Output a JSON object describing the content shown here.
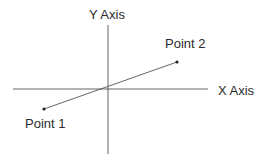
{
  "diagram": {
    "type": "coordinate-plane-line-segment",
    "axes": {
      "x_label": "X Axis",
      "y_label": "Y Axis"
    },
    "points": [
      {
        "label": "Point 1"
      },
      {
        "label": "Point 2"
      }
    ],
    "colors": {
      "axis": "#555555",
      "segment": "#555555",
      "text": "#2b2b2b",
      "background": "#ffffff"
    }
  }
}
